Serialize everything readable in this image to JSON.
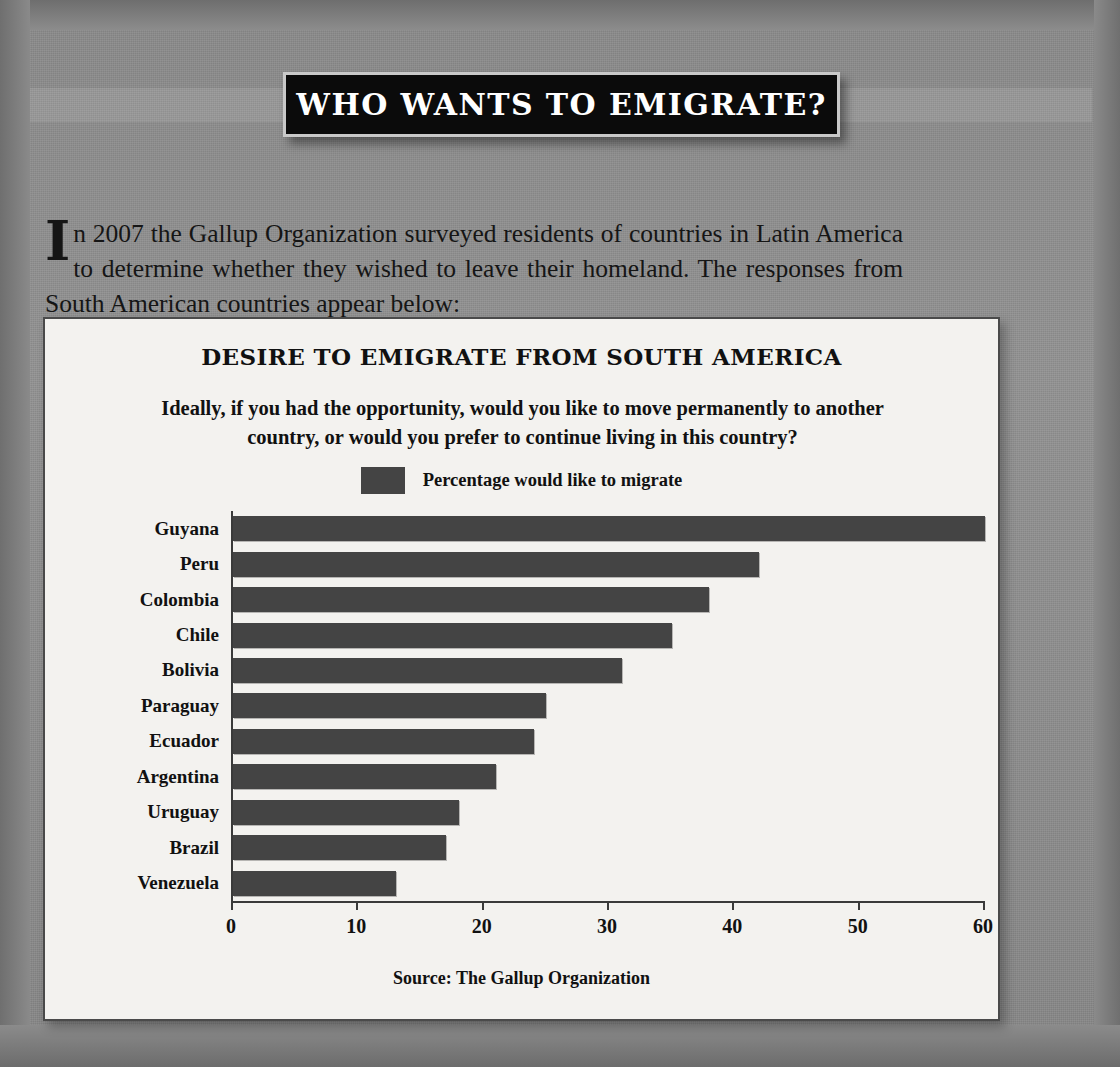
{
  "page": {
    "banner_title": "WHO WANTS TO EMIGRATE?",
    "intro_dropcap": "I",
    "intro_text": "n 2007 the Gallup Organization surveyed residents of countries in Latin America to determine whether they wished to leave their homeland. The responses from South American countries appear below:"
  },
  "chart_data": {
    "type": "bar",
    "orientation": "horizontal",
    "title": "DESIRE TO EMIGRATE FROM SOUTH AMERICA",
    "subtitle": "Ideally, if you had the opportunity, would you like to move permanently to another country, or would you prefer to continue living in this country?",
    "legend": [
      {
        "label": "Percentage would like to migrate",
        "color": "#444444"
      }
    ],
    "legend_position": "top-center",
    "categories": [
      "Guyana",
      "Peru",
      "Colombia",
      "Chile",
      "Bolivia",
      "Paraguay",
      "Ecuador",
      "Argentina",
      "Uruguay",
      "Brazil",
      "Venezuela"
    ],
    "values": [
      60,
      42,
      38,
      35,
      31,
      25,
      24,
      21,
      18,
      17,
      13
    ],
    "series": [
      {
        "name": "Percentage would like to migrate",
        "values": [
          60,
          42,
          38,
          35,
          31,
          25,
          24,
          21,
          18,
          17,
          13
        ]
      }
    ],
    "xlabel": "",
    "ylabel": "",
    "xlim": [
      0,
      60
    ],
    "xticks": [
      0,
      10,
      20,
      30,
      40,
      50,
      60
    ],
    "xtick_labels": [
      "0",
      "10",
      "20",
      "30",
      "40",
      "50",
      "60"
    ],
    "grid": false,
    "source": "Source: The Gallup Organization"
  },
  "colors": {
    "bar": "#444444",
    "panel_bg": "#f3f2ef",
    "page_bg": "#8e8e8e",
    "banner_bg": "#0b0b0b",
    "banner_border": "#c9c9c9",
    "text": "#111111"
  }
}
